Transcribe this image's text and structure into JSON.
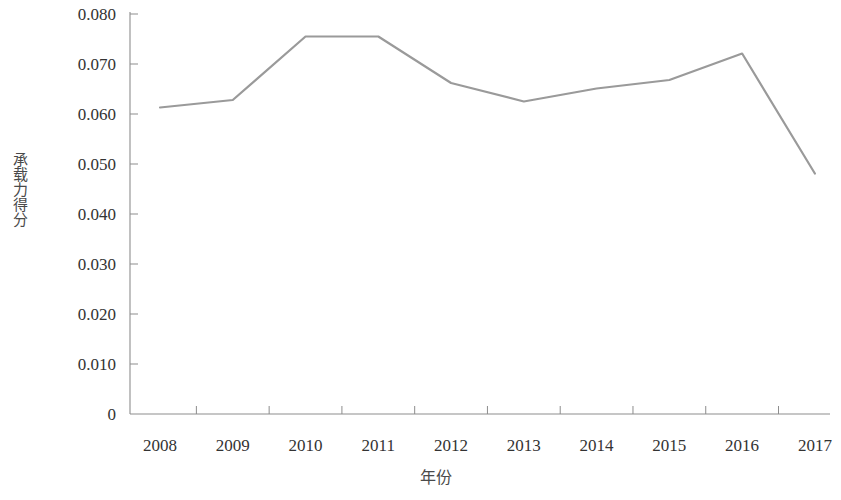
{
  "chart_data": {
    "type": "line",
    "title": "",
    "subtitle": "",
    "xlabel": "年份",
    "ylabel": "承载力得分",
    "categories": [
      "2008",
      "2009",
      "2010",
      "2011",
      "2012",
      "2013",
      "2014",
      "2015",
      "2016",
      "2017"
    ],
    "x": [
      2008,
      2009,
      2010,
      2011,
      2012,
      2013,
      2014,
      2015,
      2016,
      2017
    ],
    "values": [
      0.0613,
      0.0628,
      0.0755,
      0.0755,
      0.0662,
      0.0625,
      0.0651,
      0.0668,
      0.0721,
      0.0481
    ],
    "series": [
      {
        "name": "承载力得分",
        "values": [
          0.0613,
          0.0628,
          0.0755,
          0.0755,
          0.0662,
          0.0625,
          0.0651,
          0.0668,
          0.0721,
          0.0481
        ],
        "color": "#9a9a9a"
      }
    ],
    "ylim": [
      0,
      0.08
    ],
    "xlim": [
      2008,
      2017
    ],
    "ytick_labels": [
      "0.080",
      "0.070",
      "0.060",
      "0.050",
      "0.040",
      "0.030",
      "0.020",
      "0.010",
      "0"
    ],
    "ytick_values": [
      0.08,
      0.07,
      0.06,
      0.05,
      0.04,
      0.03,
      0.02,
      0.01,
      0
    ],
    "grid": false,
    "legend": false,
    "legend_position": "none",
    "line_color": "#9a9a9a",
    "axis_color": "#8d8d8d",
    "markers": false
  },
  "axis": {
    "y_title": "承载力得分",
    "x_title": "年份"
  },
  "colors": {
    "line": "#9a9a9a",
    "axis": "#8d8d8d",
    "text": "#333333",
    "background": "#ffffff"
  }
}
